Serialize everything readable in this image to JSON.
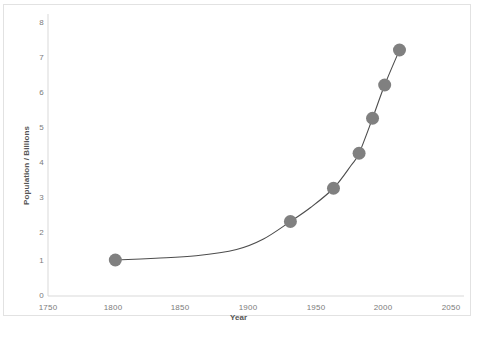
{
  "chart_data": {
    "type": "scatter",
    "title": "",
    "xlabel": "Year",
    "ylabel": "Population / Billions",
    "xlim": [
      1750,
      2050
    ],
    "ylim": [
      0,
      8
    ],
    "xticks": [
      1750,
      1800,
      1850,
      1900,
      1950,
      2000,
      2050
    ],
    "yticks": [
      0,
      1,
      2,
      3,
      4,
      5,
      6,
      7,
      8
    ],
    "grid": false,
    "legend": false,
    "marker_color": "#808080",
    "line_color": "#4d4d4d",
    "axis_color": "#d9d9d9",
    "tick_label_color": "#7b7b7b",
    "series": [
      {
        "name": "World population",
        "x": [
          1800,
          1930,
          1962,
          1981,
          1991,
          2000,
          2011
        ],
        "y": [
          1.0,
          2.1,
          3.05,
          4.05,
          5.05,
          6.0,
          7.0
        ]
      }
    ],
    "curve": {
      "description": "smooth exponential-like trend through points",
      "x": [
        1800,
        1830,
        1860,
        1890,
        1910,
        1930,
        1945,
        1962,
        1975,
        1981,
        1991,
        2000,
        2011
      ],
      "y": [
        1.0,
        1.05,
        1.12,
        1.3,
        1.6,
        2.1,
        2.5,
        3.05,
        3.7,
        4.05,
        5.05,
        6.0,
        7.0
      ]
    }
  },
  "axes": {
    "y_tick_labels": [
      "8",
      "7",
      "6",
      "5",
      "4",
      "3",
      "2",
      "1",
      "0"
    ],
    "x_tick_labels": [
      "1750",
      "1800",
      "1850",
      "1900",
      "1950",
      "2000",
      "2050"
    ],
    "y_axis_title": "Population / Billions",
    "x_axis_title": "Year"
  }
}
